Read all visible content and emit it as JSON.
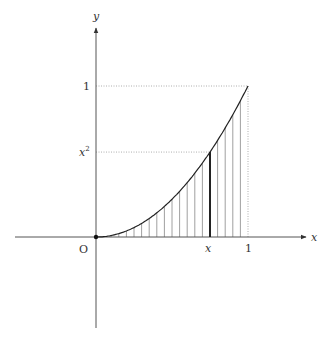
{
  "diagram": {
    "origin_label": "O",
    "x_axis_label": "x",
    "y_axis_label": "y",
    "x_ticks": [
      {
        "label": "x",
        "value": 0.75
      },
      {
        "label": "1",
        "value": 1
      }
    ],
    "y_ticks": [
      {
        "label": "1",
        "value": 1
      },
      {
        "label": "x",
        "sup": "2",
        "value": 0.5625
      }
    ],
    "curve": "y = x^2",
    "shading": "vertical hatch lines from 0 to 1",
    "hatch_count": 20,
    "highlight_x": 0.75,
    "colors": {
      "axis": "#555555",
      "curve": "#222222",
      "hatch": "#888888",
      "dotted": "#999999",
      "highlight": "#222222"
    }
  }
}
